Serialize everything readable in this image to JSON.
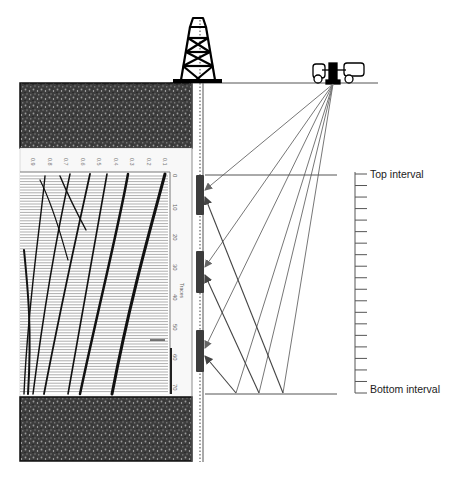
{
  "diagram": {
    "labels": {
      "top_interval": "Top interval",
      "bottom_interval": "Bottom interval"
    },
    "seismic_panel": {
      "top_axis_ticks": [
        "0.9",
        "0.8",
        "0.7",
        "0.6",
        "0.5",
        "0.4",
        "0.3",
        "0.2",
        "0.1"
      ],
      "right_axis_ticks": [
        "0",
        "10",
        "20",
        "30",
        "40",
        "50",
        "60",
        "70"
      ],
      "right_axis_label": "Traces"
    },
    "icons": [
      "drilling-rig-icon",
      "vibroseis-truck-icon",
      "receiver-tool-icon"
    ],
    "colors": {
      "rock": "#3a3a3a",
      "ray": "#666666",
      "reflector": "#555555",
      "receiver": "#3c3c3c"
    },
    "scale_ticks": 20,
    "receivers": 3
  }
}
